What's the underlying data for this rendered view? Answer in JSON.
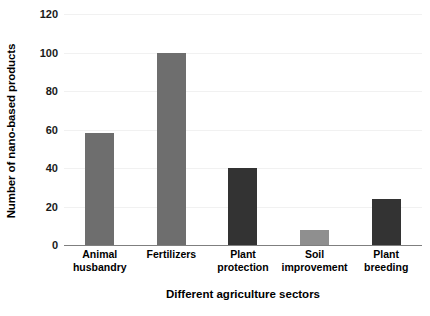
{
  "chart_data": {
    "type": "bar",
    "title": "",
    "subtitle": "",
    "xlabel": "Different agriculture sectors",
    "ylabel": "Number of nano-based products",
    "categories": [
      "Animal husbandry",
      "Fertilizers",
      "Plant protection",
      "Soil improvement",
      "Plant breeding"
    ],
    "values": [
      58,
      100,
      40,
      8,
      24
    ],
    "bar_colors": [
      "#6e6e6e",
      "#6e6e6e",
      "#333333",
      "#8f8f8f",
      "#333333"
    ],
    "ylim": [
      0,
      120
    ],
    "ytick_labels": [
      "0",
      "20",
      "40",
      "60",
      "80",
      "100",
      "120"
    ],
    "ytick_values": [
      0,
      20,
      40,
      60,
      80,
      100,
      120
    ],
    "grid": "horizontal",
    "gridline_color": "#f1f1f1",
    "axis_line_color": "#7f7f7f",
    "legend": "none",
    "annotations": []
  },
  "axis": {
    "y_title": "Number of nano-based products",
    "x_title": "Different agriculture sectors"
  },
  "ticks": {
    "y": [
      {
        "label": "120",
        "value": 120
      },
      {
        "label": "100",
        "value": 100
      },
      {
        "label": "80",
        "value": 80
      },
      {
        "label": "60",
        "value": 60
      },
      {
        "label": "40",
        "value": 40
      },
      {
        "label": "20",
        "value": 20
      },
      {
        "label": "0",
        "value": 0
      }
    ]
  },
  "categories": [
    {
      "line1": "Animal",
      "line2": "husbandry",
      "full": "Animal husbandry",
      "value": 58
    },
    {
      "line1": "Fertilizers",
      "line2": "",
      "full": "Fertilizers",
      "value": 100
    },
    {
      "line1": "Plant protection",
      "line2": "",
      "full": "Plant protection",
      "value": 40
    },
    {
      "line1": "Soil",
      "line2": "improvement",
      "full": "Soil improvement",
      "value": 8
    },
    {
      "line1": "Plant breeding",
      "line2": "",
      "full": "Plant breeding",
      "value": 24
    }
  ]
}
